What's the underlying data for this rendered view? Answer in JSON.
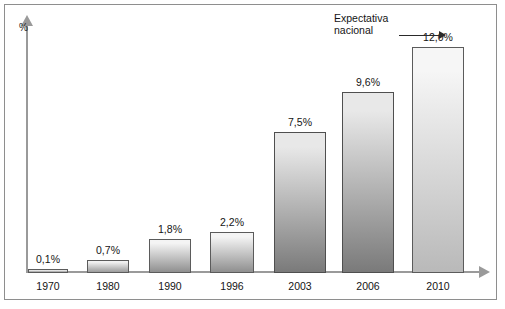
{
  "chart_data": {
    "type": "bar",
    "title": "",
    "subtitle": "",
    "xlabel": "",
    "ylabel": "%",
    "ylim": [
      0,
      13.2
    ],
    "grid": false,
    "legend": null,
    "categories": [
      "1970",
      "1980",
      "1990",
      "1996",
      "2003",
      "2006",
      "2010"
    ],
    "values": [
      0.1,
      0.7,
      1.8,
      2.2,
      7.5,
      9.6,
      12.0
    ],
    "data_labels": [
      "0,1%",
      "0,7%",
      "1,8%",
      "2,2%",
      "7,5%",
      "9,6%",
      "12,0%"
    ],
    "annotations": [
      {
        "text_line1": "Expectativa",
        "text_line2": "nacional",
        "points_to": "2010"
      }
    ],
    "bar_colors": [
      {
        "top": "#f2f2f2",
        "bottom": "#9b9b9b",
        "border": "#5b5b5b"
      },
      {
        "top": "#f2f2f2",
        "bottom": "#9b9b9b",
        "border": "#5b5b5b"
      },
      {
        "top": "#f4f4f4",
        "bottom": "#8f8f8f",
        "border": "#5b5b5b"
      },
      {
        "top": "#f4f4f4",
        "bottom": "#8f8f8f",
        "border": "#5b5b5b"
      },
      {
        "top": "#e8e8e8",
        "bottom": "#7a7a7a",
        "border": "#4f4f4f"
      },
      {
        "top": "#e8e8e8",
        "bottom": "#7a7a7a",
        "border": "#4f4f4f"
      },
      {
        "top": "#f6f6f6",
        "bottom": "#b9b9b9",
        "border": "#5b5b5b"
      }
    ]
  },
  "axis": {
    "y_unit_label": "%"
  }
}
